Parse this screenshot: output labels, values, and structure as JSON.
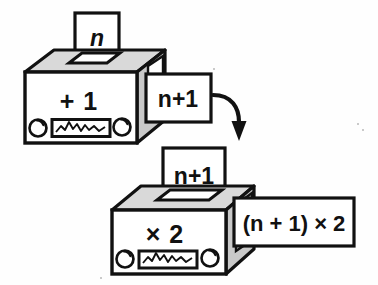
{
  "figure": {
    "background_color": "#fefefe",
    "ink_color": "#111111",
    "box_front_color": "#ffffff",
    "box_top_color": "#d9d9d9",
    "box_side_color": "#c9c9c9",
    "card_color": "#ffffff"
  },
  "machines": [
    {
      "id": "machine-plus-one",
      "operation_label": "+ 1",
      "input_card_label": "n",
      "output_card_label": "n+1",
      "knob_count": 2,
      "meter_label": "waveform-meter"
    },
    {
      "id": "machine-times-two",
      "operation_label": "× 2",
      "input_card_label": "n+1",
      "output_card_label": "(n + 1) × 2",
      "knob_count": 2,
      "meter_label": "waveform-meter"
    }
  ],
  "connector": {
    "id": "flow-arrow",
    "label": "curved-down-arrow",
    "direction": "down"
  },
  "icons": {
    "knob": "knob-icon",
    "meter": "waveform-meter-icon",
    "arrow": "curved-arrow-icon",
    "slot": "card-slot-icon"
  }
}
